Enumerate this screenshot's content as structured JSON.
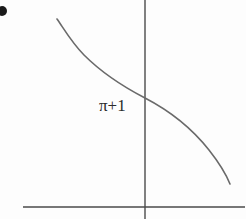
{
  "figure": {
    "kind": "hand-drawn-graph-scan",
    "width": 246,
    "height": 219,
    "background_color": "#fdfdfd",
    "bullet": {
      "name": "list-bullet",
      "center_x": 2,
      "center_y": 11,
      "radius": 5,
      "color": "#1a1a1a"
    },
    "label": {
      "text": "π+1",
      "x": 99,
      "y": 96,
      "color": "#2b2b2b",
      "font_size": 17
    },
    "axes": {
      "color": "#4a4a4a",
      "stroke_width": 1.4,
      "y_axis": {
        "x": 145,
        "y_start": 0,
        "y_end": 219
      },
      "x_axis": {
        "y": 207,
        "x_start": 23,
        "x_end": 245
      },
      "origin_x": 145,
      "origin_y": 207
    },
    "curve": {
      "color": "#6a6a6a",
      "stroke_width": 1.6,
      "direction": "decreasing",
      "start_point": [
        57,
        19
      ],
      "end_point": [
        230,
        184
      ],
      "axis_crossing": [
        145,
        98
      ],
      "path": "M 57 19 C 64 29 72 43 84 55 C 99 70 118 84 145 98 C 172 112 194 131 209 150 C 220 164 226 174 230 184"
    }
  },
  "chart_data": {
    "type": "line",
    "title": "",
    "xlabel": "",
    "ylabel": "",
    "annotations": [
      {
        "text": "π+1",
        "x": 99,
        "y": 96,
        "target": "y-intercept-label"
      }
    ],
    "grid": false,
    "legend": null,
    "xlim": [
      23,
      245
    ],
    "ylim": [
      0,
      219
    ],
    "series": [
      {
        "name": "curve",
        "color": "#6a6a6a",
        "points_px": [
          [
            57,
            19
          ],
          [
            70,
            40
          ],
          [
            84,
            55
          ],
          [
            95,
            62
          ],
          [
            120,
            80
          ],
          [
            145,
            98
          ],
          [
            170,
            112
          ],
          [
            195,
            133
          ],
          [
            209,
            150
          ],
          [
            220,
            163
          ],
          [
            230,
            184
          ]
        ]
      }
    ]
  }
}
